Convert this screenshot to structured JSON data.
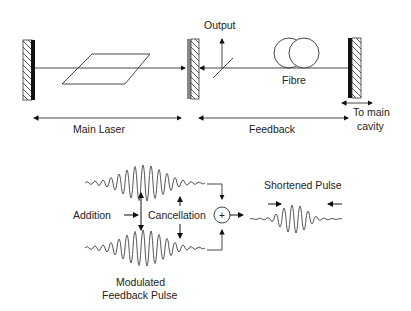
{
  "diagram": {
    "labels": {
      "output": "Output",
      "fibre": "Fibre",
      "main_laser": "Main Laser",
      "feedback": "Feedback",
      "to_main_cavity_line1": "To main",
      "to_main_cavity_line2": "cavity",
      "addition": "Addition",
      "cancellation": "Cancellation",
      "shortened_pulse": "Shortened Pulse",
      "modulated_line1": "Modulated",
      "modulated_line2": "Feedback Pulse",
      "sum_symbol": "+"
    },
    "components": [
      "left-mirror-icon",
      "gain-medium-icon",
      "output-coupler-mirror-icon",
      "beam-splitter-icon",
      "fibre-coil-icon",
      "right-mirror-icon",
      "summing-junction-icon"
    ],
    "colors": {
      "line": "#333333",
      "mirror_dark": "#111111",
      "mirror_grey": "#888888"
    }
  }
}
